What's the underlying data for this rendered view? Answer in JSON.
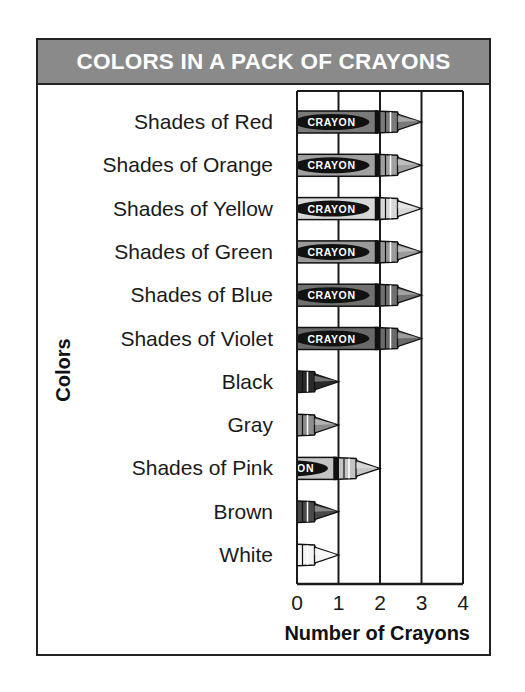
{
  "chart_data": {
    "type": "bar",
    "orientation": "horizontal",
    "style": "pictograph-crayons",
    "title": "COLORS IN A PACK OF CRAYONS",
    "xlabel": "Number of Crayons",
    "ylabel": "Colors",
    "categories": [
      "Shades of Red",
      "Shades of Orange",
      "Shades of Yellow",
      "Shades of Green",
      "Shades of Blue",
      "Shades of Violet",
      "Black",
      "Gray",
      "Shades of Pink",
      "Brown",
      "White"
    ],
    "values": [
      3,
      3,
      3,
      3,
      3,
      3,
      1,
      1,
      2,
      1,
      1
    ],
    "xlim": [
      0,
      4
    ],
    "x_ticks": [
      "0",
      "1",
      "2",
      "3",
      "4"
    ],
    "grid": true,
    "legend": null,
    "crayon_label": "CRAYON",
    "shades": [
      "#7a7a7a",
      "#a0a0a0",
      "#d8d8d8",
      "#9a9a9a",
      "#707070",
      "#6a6a6a",
      "#2a2a2a",
      "#8c8c8c",
      "#c4c4c4",
      "#4a4a4a",
      "#f4f4f4"
    ]
  },
  "colors": {
    "header_bg": "#8a8a8a",
    "header_text": "#ffffff",
    "border": "#222222"
  }
}
